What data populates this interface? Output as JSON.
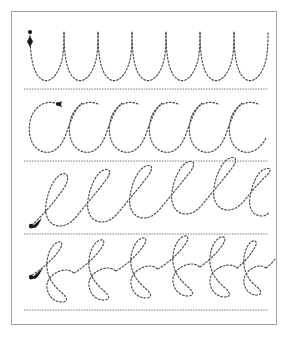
{
  "worksheet": {
    "title": "Cursive Stroke Tracing Practice",
    "background_color": "#ffffff",
    "frame_color": "#a3a3a3",
    "stroke_color": "#4a4a4a",
    "rule_color": "#6e6e6e",
    "marker_color": "#1a1a1a"
  },
  "rules": [
    {
      "name": "rule-line-1",
      "y": 89,
      "x_start": 24,
      "x_end": 268
    },
    {
      "name": "rule-line-2",
      "y": 161,
      "x_start": 24,
      "x_end": 268
    },
    {
      "name": "rule-line-3",
      "y": 234,
      "x_start": 24,
      "x_end": 268
    },
    {
      "name": "rule-line-4",
      "y": 310,
      "x_start": 24,
      "x_end": 268
    }
  ],
  "rows": [
    {
      "name": "row-undercurve-u",
      "stroke_label": "undercurve",
      "glyph": "u",
      "repetitions": 7,
      "start_marker": {
        "type": "dot-with-down-arrow",
        "x": 30,
        "y": 32,
        "direction": "down"
      },
      "baseline_y": 80,
      "top_y": 32,
      "unit_width": 34,
      "first_x": 30
    },
    {
      "name": "row-overcurve-c",
      "stroke_label": "overcurve",
      "glyph": "c",
      "repetitions": 6,
      "start_marker": {
        "type": "dot-with-arrow",
        "x": 58,
        "y": 104,
        "direction": "left"
      },
      "baseline_y": 152,
      "top_y": 103,
      "unit_width": 40,
      "first_x": 30
    },
    {
      "name": "row-loop-e",
      "stroke_label": "loop",
      "glyph": "e",
      "repetitions": 6,
      "start_marker": {
        "type": "dot-with-arrow",
        "x": 32,
        "y": 225,
        "direction": "up-right"
      },
      "baseline_y": 226,
      "top_y": 174,
      "unit_width": 40,
      "first_x": 32
    },
    {
      "name": "row-double-loop-f",
      "stroke_label": "double-loop",
      "glyph": "f",
      "repetitions": 7,
      "start_marker": {
        "type": "dot-with-arrow",
        "x": 32,
        "y": 275,
        "direction": "up-right"
      },
      "baseline_y": 300,
      "top_y": 245,
      "unit_width": 34,
      "first_x": 32
    }
  ],
  "chart_data": {
    "type": "table",
    "categories": [
      "undercurve u",
      "overcurve c",
      "loop e",
      "double-loop f"
    ],
    "values": [
      7,
      6,
      6,
      7
    ],
    "xlabel": "stroke row",
    "ylabel": "repetitions"
  }
}
